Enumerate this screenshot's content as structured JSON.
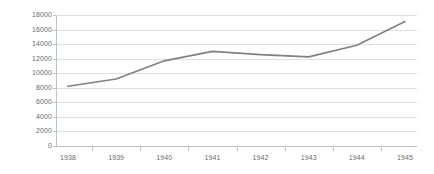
{
  "chart_data": {
    "type": "line",
    "title": "",
    "subtitle": "",
    "xlabel": "",
    "ylabel": "",
    "categories": [
      "1938",
      "1939",
      "1940",
      "1941",
      "1942",
      "1943",
      "1944",
      "1945"
    ],
    "series": [
      {
        "name": "Series 1",
        "color": "#808080",
        "values": [
          8200,
          9200,
          11700,
          13000,
          12550,
          12250,
          13850,
          17100
        ]
      }
    ],
    "ylim": [
      0,
      18000
    ],
    "ytick_step": 2000,
    "yticks": [
      0,
      2000,
      4000,
      6000,
      8000,
      10000,
      12000,
      14000,
      16000,
      18000
    ],
    "ytick_labels": [
      "0",
      "2000",
      "4000",
      "6000",
      "8000",
      "10000",
      "12000",
      "14000",
      "16000",
      "18000"
    ],
    "xticks": [
      "1938",
      "1939",
      "1940",
      "1941",
      "1942",
      "1943",
      "1944",
      "1945"
    ],
    "grid": true,
    "grid_axis": "y",
    "grid_color": "#d9e2e2",
    "axis_color": "#b9c4c4",
    "legend": false,
    "legend_position": "none",
    "markers": false,
    "background": "#ffffff",
    "tick_label_color": "#6b6b6b"
  }
}
